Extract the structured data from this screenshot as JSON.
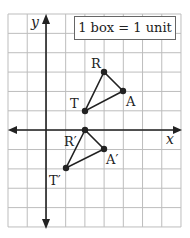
{
  "diagram": {
    "type": "coordinate-grid-translation",
    "legend": "1 box = 1 unit",
    "axes": {
      "x_label": "x",
      "y_label": "y"
    },
    "grid": {
      "x_range": [
        -2,
        7
      ],
      "y_range": [
        -5,
        6
      ]
    },
    "original": {
      "R": {
        "label": "R",
        "x": 3,
        "y": 3
      },
      "A": {
        "label": "A",
        "x": 4,
        "y": 2
      },
      "T": {
        "label": "T",
        "x": 2,
        "y": 1
      }
    },
    "image": {
      "R": {
        "label": "R′",
        "x": 2,
        "y": 0
      },
      "A": {
        "label": "A′",
        "x": 3,
        "y": -1
      },
      "T": {
        "label": "T′",
        "x": 1,
        "y": -2
      }
    },
    "colors": {
      "grid": "#bdbdbd",
      "ink": "#222222"
    }
  }
}
